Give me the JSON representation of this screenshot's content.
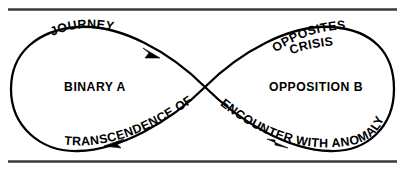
{
  "figure": {
    "type": "lemniscate-flow-diagram",
    "shape_name": "infinity-loop",
    "background_color": "#ffffff",
    "line_color": "#000000",
    "rule_color": "#3a3a3a",
    "labels": {
      "top_left_curve": "JOURNEY",
      "top_right_curve": "OPPOSITES",
      "crisis": "CRISIS",
      "left_loop_center": "BINARY A",
      "right_loop_center": "OPPOSITION B",
      "bottom_left_curve": "TRANSCENDENCE OF",
      "bottom_right_curve": "ENCOUNTER WITH ANOMALY"
    },
    "arrows": [
      {
        "name": "arrow-journey-descending",
        "direction": "down-right"
      },
      {
        "name": "arrow-transcendence-leftward",
        "direction": "left"
      },
      {
        "name": "arrow-encounter-descending",
        "direction": "down-right"
      }
    ],
    "rules": [
      {
        "name": "top-rule"
      },
      {
        "name": "bottom-rule"
      }
    ]
  }
}
